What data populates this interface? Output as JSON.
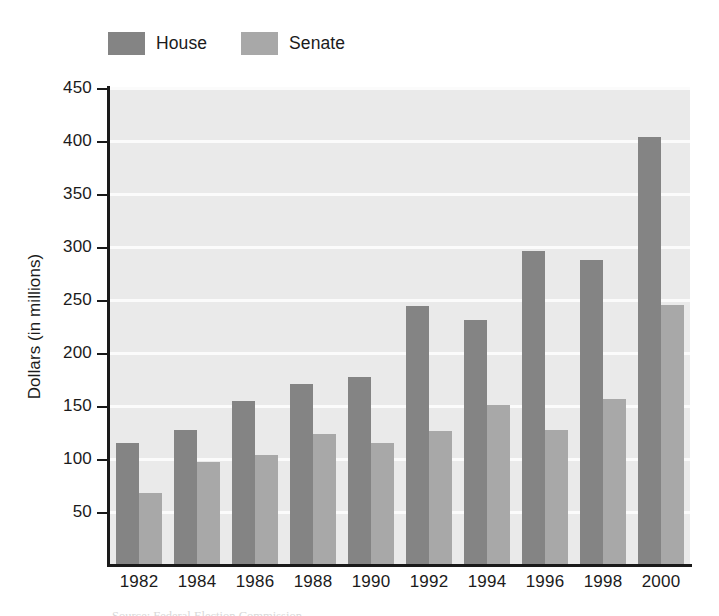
{
  "chart_data": {
    "type": "bar",
    "title": "",
    "xlabel": "",
    "ylabel": "Dollars (in millions)",
    "categories": [
      "1982",
      "1984",
      "1986",
      "1988",
      "1990",
      "1992",
      "1994",
      "1996",
      "1998",
      "2000"
    ],
    "series": [
      {
        "name": "House",
        "color": "#848484",
        "values": [
          115,
          127,
          155,
          171,
          177,
          244,
          231,
          296,
          288,
          404
        ]
      },
      {
        "name": "Senate",
        "color": "#a8a8a8",
        "values": [
          68,
          97,
          104,
          124,
          115,
          126,
          151,
          127,
          157,
          245
        ]
      }
    ],
    "ylim": [
      0,
      450
    ],
    "ytick_labels": [
      "50",
      "100",
      "150",
      "200",
      "250",
      "300",
      "350",
      "400",
      "450"
    ],
    "ytick_values": [
      50,
      100,
      150,
      200,
      250,
      300,
      350,
      400,
      450
    ],
    "ytick_step": 50,
    "grid": true,
    "grid_color": "#fbfbfb",
    "plot_background": "#eaeaea",
    "axis_color": "#1a1a1a",
    "legend_position": "above-left"
  },
  "legend": {
    "entries": [
      {
        "label": "House",
        "color": "#848484"
      },
      {
        "label": "Senate",
        "color": "#a8a8a8"
      }
    ]
  },
  "caption": {
    "text": "Source: Federal Election Commission"
  }
}
